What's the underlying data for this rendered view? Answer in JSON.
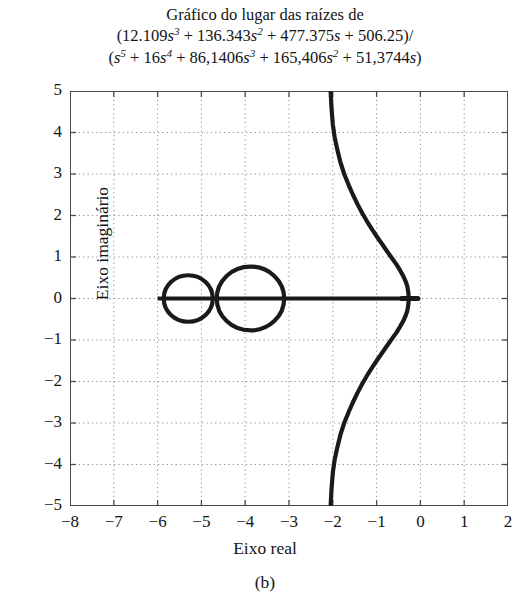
{
  "figure": {
    "title_lines": [
      "Gráfico do lugar das raízes de",
      "(12.109s^3 + 136.343s^2 + 477.375s + 506.25)/",
      "(s^5 + 16s^4 + 86,1406s^3 + 165,406s^2 + 51,3744s)"
    ],
    "caption": "(b)",
    "numerator_text": "(12.109s³ + 136.343s² + 477.375s + 506.25)/",
    "denominator_text": "(s⁵ + 16s⁴ + 86,1406s³ + 165,406s² + 51,3744s)"
  },
  "chart_data": {
    "type": "line",
    "subtitle": "",
    "xlabel": "Eixo real",
    "ylabel": "Eixo imaginário",
    "xlim": [
      -8,
      2
    ],
    "ylim": [
      -5,
      5
    ],
    "xticks": [
      -8,
      -7,
      -6,
      -5,
      -4,
      -3,
      -2,
      -1,
      0,
      1,
      2
    ],
    "yticks": [
      5,
      4,
      3,
      2,
      1,
      0,
      -1,
      -2,
      -3,
      -4,
      -5
    ],
    "xtick_labels": [
      "−8",
      "−7",
      "−6",
      "−5",
      "−4",
      "−3",
      "−2",
      "−1",
      "0",
      "1",
      "2"
    ],
    "ytick_labels": [
      "5",
      "4",
      "3",
      "2",
      "1",
      "0",
      "−1",
      "−2",
      "−3",
      "−4",
      "−5"
    ],
    "grid": true,
    "grid_style": "dotted",
    "legend": null,
    "legend_position": "none",
    "line_color": "#1a1a1a",
    "grid_color": "#8c8c8c",
    "axis_color": "#4a4a4a",
    "series": [
      {
        "name": "real-axis-locus-segment",
        "type": "segment",
        "comment": "Heavy horizontal branch on the real axis",
        "x_start": -6.0,
        "x_end": -0.28,
        "y": 0
      },
      {
        "name": "circular-locus-left",
        "type": "circle",
        "center": [
          -5.3,
          0
        ],
        "radius": 0.56
      },
      {
        "name": "circular-locus-right",
        "type": "circle",
        "center": [
          -3.88,
          0
        ],
        "radius": 0.77
      },
      {
        "name": "complex-branch-upper",
        "type": "path",
        "points": [
          [
            -2.05,
            5.0
          ],
          [
            -2.03,
            4.6
          ],
          [
            -2.0,
            4.2
          ],
          [
            -1.96,
            3.9
          ],
          [
            -1.9,
            3.6
          ],
          [
            -1.83,
            3.3
          ],
          [
            -1.74,
            3.0
          ],
          [
            -1.64,
            2.74
          ],
          [
            -1.54,
            2.5
          ],
          [
            -1.44,
            2.28
          ],
          [
            -1.33,
            2.06
          ],
          [
            -1.22,
            1.86
          ],
          [
            -1.1,
            1.66
          ],
          [
            -0.98,
            1.47
          ],
          [
            -0.86,
            1.29
          ],
          [
            -0.75,
            1.12
          ],
          [
            -0.64,
            0.96
          ],
          [
            -0.54,
            0.81
          ],
          [
            -0.46,
            0.67
          ],
          [
            -0.39,
            0.54
          ],
          [
            -0.34,
            0.42
          ],
          [
            -0.3,
            0.3
          ],
          [
            -0.28,
            0.18
          ],
          [
            -0.27,
            0.08
          ],
          [
            -0.27,
            0.0
          ]
        ]
      },
      {
        "name": "complex-branch-lower",
        "type": "path",
        "mirror_of": "complex-branch-upper",
        "points": [
          [
            -2.05,
            -5.0
          ],
          [
            -2.03,
            -4.6
          ],
          [
            -2.0,
            -4.2
          ],
          [
            -1.96,
            -3.9
          ],
          [
            -1.9,
            -3.6
          ],
          [
            -1.83,
            -3.3
          ],
          [
            -1.74,
            -3.0
          ],
          [
            -1.64,
            -2.74
          ],
          [
            -1.54,
            -2.5
          ],
          [
            -1.44,
            -2.28
          ],
          [
            -1.33,
            -2.06
          ],
          [
            -1.22,
            -1.86
          ],
          [
            -1.1,
            -1.66
          ],
          [
            -0.98,
            -1.47
          ],
          [
            -0.86,
            -1.29
          ],
          [
            -0.75,
            -1.12
          ],
          [
            -0.64,
            -0.96
          ],
          [
            -0.54,
            -0.81
          ],
          [
            -0.46,
            -0.67
          ],
          [
            -0.39,
            -0.54
          ],
          [
            -0.34,
            -0.42
          ],
          [
            -0.3,
            -0.3
          ],
          [
            -0.28,
            -0.18
          ],
          [
            -0.27,
            -0.08
          ],
          [
            -0.27,
            0.0
          ]
        ]
      },
      {
        "name": "origin-cluster",
        "type": "marker-cluster",
        "comment": "Dense cluster of locus points just left of the origin",
        "x_start": -0.42,
        "x_end": -0.06,
        "y": 0
      }
    ]
  }
}
